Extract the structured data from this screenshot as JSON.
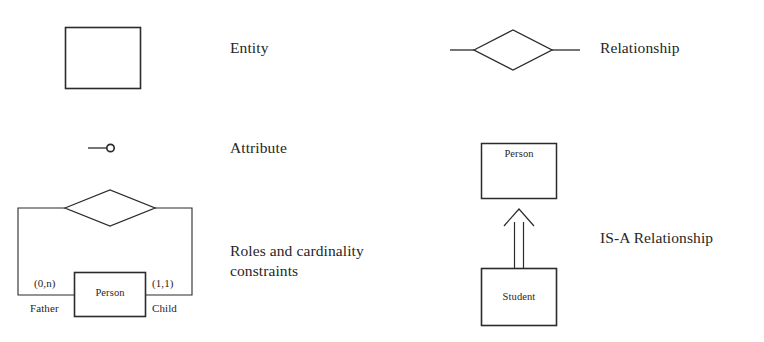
{
  "diagram": {
    "background_color": "#ffffff",
    "stroke_color": "#2b2b2b",
    "items": [
      {
        "id": "entity",
        "label": "Entity",
        "symbol": "rectangle"
      },
      {
        "id": "relationship",
        "label": "Relationship",
        "symbol": "diamond-with-connectors"
      },
      {
        "id": "attribute",
        "label": "Attribute",
        "symbol": "line-with-circle"
      },
      {
        "id": "roles-cardinality",
        "label": "Roles and cardinality constraints",
        "symbol": "recursive-relationship"
      },
      {
        "id": "is-a",
        "label": "IS-A Relationship",
        "symbol": "generalization-arrow"
      }
    ]
  },
  "roles_example": {
    "entity_name": "Person",
    "left_cardinality": "(0,n)",
    "right_cardinality": "(1,1)",
    "left_role": "Father",
    "right_role": "Child"
  },
  "isa_example": {
    "parent_entity": "Person",
    "child_entity": "Student"
  }
}
